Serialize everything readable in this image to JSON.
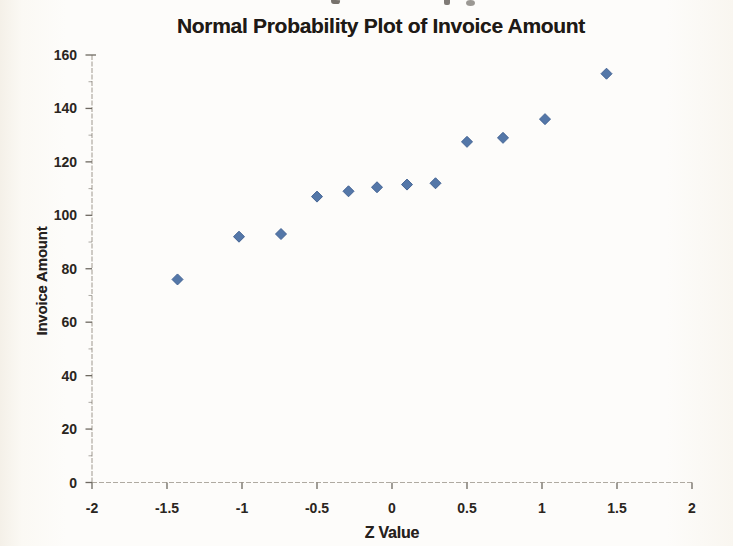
{
  "chart_data": {
    "type": "scatter",
    "title": "Normal Probability Plot of Invoice Amount",
    "xlabel": "Z Value",
    "ylabel": "Invoice Amount",
    "xlim": [
      -2,
      2
    ],
    "ylim": [
      0,
      160
    ],
    "xtick_values": [
      -2,
      -1.5,
      -1,
      -0.5,
      0,
      0.5,
      1,
      1.5,
      2
    ],
    "xtick_labels": [
      "-2",
      "-1.5",
      "-1",
      "-0.5",
      "0",
      "0.5",
      "1",
      "1.5",
      "2"
    ],
    "ytick_values": [
      0,
      20,
      40,
      60,
      80,
      100,
      120,
      140,
      160
    ],
    "ytick_labels": [
      "0",
      "20",
      "40",
      "60",
      "80",
      "100",
      "120",
      "140",
      "160"
    ],
    "ytick_minor_step": 10,
    "grid": false,
    "legend": "none",
    "marker": {
      "shape": "diamond",
      "size": 11
    },
    "series": [
      {
        "name": "Invoice Amount",
        "x": [
          -1.43,
          -1.02,
          -0.74,
          -0.5,
          -0.29,
          -0.1,
          0.1,
          0.29,
          0.5,
          0.74,
          1.02,
          1.43
        ],
        "y": [
          76,
          92,
          93,
          107,
          109,
          110.5,
          111.5,
          112,
          127.5,
          129,
          136,
          153
        ]
      }
    ]
  },
  "colors": {
    "marker_fill": "#4e72a5",
    "marker_edge": "#3d5e90",
    "axis_line": "#a29c92",
    "tick_mark": "#6e6961",
    "text": "#26211d",
    "background": "#fdfcfa"
  }
}
